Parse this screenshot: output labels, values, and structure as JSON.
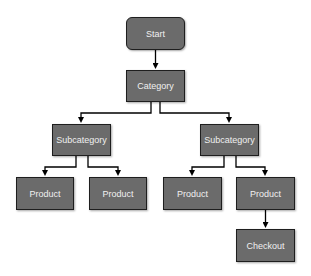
{
  "diagram": {
    "type": "tree flowchart",
    "colors": {
      "node_fill": "#6b6b6b",
      "node_border": "#1e1e1e",
      "node_text": "#f0f0f0",
      "edge": "#000000"
    },
    "nodes": [
      {
        "id": "start",
        "label": "Start",
        "shape": "rounded",
        "x": 126,
        "y": 17,
        "w": 59,
        "h": 33
      },
      {
        "id": "category",
        "label": "Category",
        "shape": "rect",
        "x": 126,
        "y": 70,
        "w": 59,
        "h": 32
      },
      {
        "id": "subcat_left",
        "label": "Subcategory",
        "shape": "rect",
        "x": 52,
        "y": 124,
        "w": 59,
        "h": 32
      },
      {
        "id": "subcat_right",
        "label": "Subcategory",
        "shape": "rect",
        "x": 200,
        "y": 124,
        "w": 59,
        "h": 32
      },
      {
        "id": "product_1",
        "label": "Product",
        "shape": "rect",
        "x": 16,
        "y": 177,
        "w": 58,
        "h": 33
      },
      {
        "id": "product_2",
        "label": "Product",
        "shape": "rect",
        "x": 89,
        "y": 177,
        "w": 58,
        "h": 33
      },
      {
        "id": "product_3",
        "label": "Product",
        "shape": "rect",
        "x": 163,
        "y": 177,
        "w": 59,
        "h": 33
      },
      {
        "id": "product_4",
        "label": "Product",
        "shape": "rect",
        "x": 236,
        "y": 177,
        "w": 59,
        "h": 33
      },
      {
        "id": "checkout",
        "label": "Checkout",
        "shape": "rect",
        "x": 236,
        "y": 229,
        "w": 59,
        "h": 33
      }
    ],
    "edges": [
      {
        "from": "start",
        "to": "category"
      },
      {
        "from": "category",
        "to": "subcat_left"
      },
      {
        "from": "category",
        "to": "subcat_right"
      },
      {
        "from": "subcat_left",
        "to": "product_1"
      },
      {
        "from": "subcat_left",
        "to": "product_2"
      },
      {
        "from": "subcat_right",
        "to": "product_3"
      },
      {
        "from": "subcat_right",
        "to": "product_4"
      },
      {
        "from": "product_4",
        "to": "checkout"
      }
    ]
  }
}
